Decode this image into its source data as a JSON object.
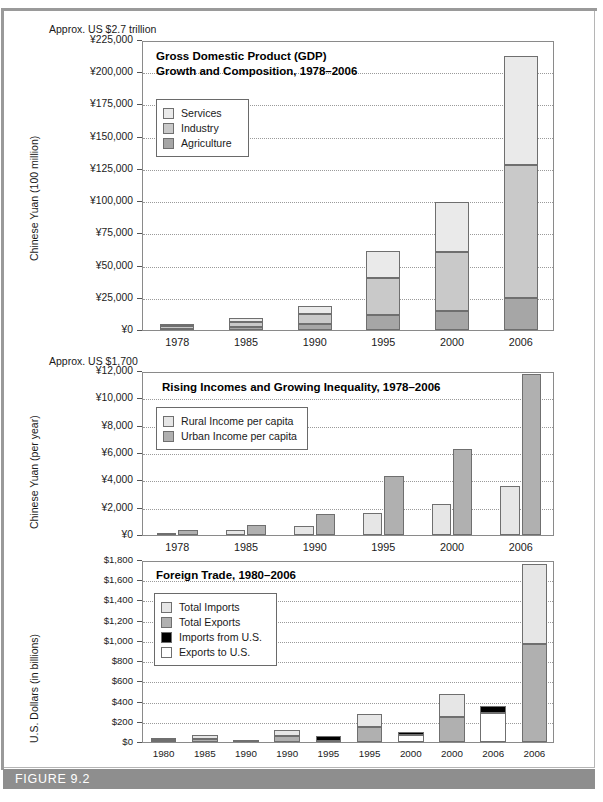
{
  "figure": {
    "caption": "FIGURE 9.2",
    "frame_border_color": "#b5b5b5",
    "caption_bar_color": "#8e8e8e"
  },
  "palette": {
    "services": "#eaeaea",
    "industry": "#c9c9c9",
    "agriculture": "#a6a6a6",
    "rural": "#e6e6e6",
    "urban": "#b0b0b0",
    "total_imports": "#e6e6e6",
    "total_exports": "#b0b0b0",
    "imports_from_us": "#000000",
    "exports_to_us": "#ffffff"
  },
  "chart_data": [
    {
      "id": "gdp",
      "type": "bar",
      "stacked": true,
      "title": "Gross Domestic Product (GDP)\nGrowth and Composition, 1978–2006",
      "title_line1": "Gross Domestic Product (GDP)",
      "title_line2": "Growth and Composition, 1978–2006",
      "note": "Approx. US $2.7 trillion",
      "ylabel": "Chinese Yuan (100 million)",
      "xlabel": "",
      "ylim": [
        0,
        225000
      ],
      "ytick_labels": [
        "¥0",
        "¥25,000",
        "¥50,000",
        "¥75,000",
        "¥100,000",
        "¥125,000",
        "¥150,000",
        "¥175,000",
        "¥200,000",
        "¥225,000"
      ],
      "ytick_values": [
        0,
        25000,
        50000,
        75000,
        100000,
        125000,
        150000,
        175000,
        200000,
        225000
      ],
      "grid": true,
      "categories": [
        "1978",
        "1985",
        "1990",
        "1995",
        "2000",
        "2006"
      ],
      "legend_position": "upper-left-inside",
      "series": [
        {
          "name": "Agriculture",
          "color_key": "agriculture",
          "values": [
            1018,
            2542,
            5017,
            12020,
            14945,
            24737
          ]
        },
        {
          "name": "Industry",
          "color_key": "industry",
          "values": [
            1745,
            3867,
            7717,
            28538,
            45556,
            103162
          ]
        },
        {
          "name": "Services",
          "color_key": "services",
          "values": [
            881,
            2585,
            5888,
            21066,
            38714,
            84721
          ]
        }
      ]
    },
    {
      "id": "incomes",
      "type": "bar",
      "stacked": false,
      "title": "Rising Incomes and Growing Inequality, 1978–2006",
      "note": "Approx. US $1,700",
      "ylabel": "Chinese Yuan (per year)",
      "xlabel": "",
      "ylim": [
        0,
        12000
      ],
      "ytick_labels": [
        "¥0",
        "¥2,000",
        "¥4,000",
        "¥6,000",
        "¥8,000",
        "¥10,000",
        "¥12,000"
      ],
      "ytick_values": [
        0,
        2000,
        4000,
        6000,
        8000,
        10000,
        12000
      ],
      "grid": true,
      "categories": [
        "1978",
        "1985",
        "1990",
        "1995",
        "2000",
        "2006"
      ],
      "legend_position": "upper-left-inside",
      "series": [
        {
          "name": "Rural Income per capita",
          "color_key": "rural",
          "values": [
            134,
            398,
            686,
            1578,
            2253,
            3587
          ]
        },
        {
          "name": "Urban Income per capita",
          "color_key": "urban",
          "values": [
            343,
            739,
            1510,
            4283,
            6280,
            11759
          ]
        }
      ]
    },
    {
      "id": "trade",
      "type": "bar",
      "stacked": true,
      "title": "Foreign Trade, 1980–2006",
      "note": "",
      "ylabel": "U.S. Dollars (in billions)",
      "xlabel": "",
      "ylim": [
        0,
        1800
      ],
      "ytick_labels": [
        "$0",
        "$200",
        "$400",
        "$600",
        "$800",
        "$1,000",
        "$1,200",
        "$1,400",
        "$1,600",
        "$1,800"
      ],
      "ytick_values": [
        0,
        200,
        400,
        600,
        800,
        1000,
        1200,
        1400,
        1600,
        1800
      ],
      "grid": true,
      "categories": [
        "1980",
        "1985",
        "1990",
        "1990",
        "1995",
        "1995",
        "2000",
        "2000",
        "2006",
        "2006"
      ],
      "legend_position": "upper-left-inside",
      "legend_entries": [
        {
          "name": "Total Imports",
          "color_key": "total_imports"
        },
        {
          "name": "Total Exports",
          "color_key": "total_exports"
        },
        {
          "name": "Imports from U.S.",
          "color_key": "imports_from_us"
        },
        {
          "name": "Exports to U.S.",
          "color_key": "exports_to_us"
        }
      ],
      "bars": [
        {
          "label": "1980",
          "segments": [
            {
              "color_key": "total_exports",
              "value": 18
            },
            {
              "color_key": "total_imports",
              "value": 20
            }
          ]
        },
        {
          "label": "1985",
          "segments": [
            {
              "color_key": "total_exports",
              "value": 27
            },
            {
              "color_key": "total_imports",
              "value": 42
            }
          ]
        },
        {
          "label": "1990",
          "segments": [
            {
              "color_key": "exports_to_us",
              "value": 5
            },
            {
              "color_key": "imports_from_us",
              "value": 16
            }
          ]
        },
        {
          "label": "1990",
          "segments": [
            {
              "color_key": "total_exports",
              "value": 62
            },
            {
              "color_key": "total_imports",
              "value": 53
            }
          ]
        },
        {
          "label": "1995",
          "segments": [
            {
              "color_key": "exports_to_us",
              "value": 12
            },
            {
              "color_key": "imports_from_us",
              "value": 46
            }
          ]
        },
        {
          "label": "1995",
          "segments": [
            {
              "color_key": "total_exports",
              "value": 149
            },
            {
              "color_key": "total_imports",
              "value": 132
            }
          ]
        },
        {
          "label": "2000",
          "segments": [
            {
              "color_key": "exports_to_us",
              "value": 68
            },
            {
              "color_key": "imports_from_us",
              "value": 33
            }
          ]
        },
        {
          "label": "2000",
          "segments": [
            {
              "color_key": "total_exports",
              "value": 249
            },
            {
              "color_key": "total_imports",
              "value": 225
            }
          ]
        },
        {
          "label": "2006",
          "segments": [
            {
              "color_key": "exports_to_us",
              "value": 288
            },
            {
              "color_key": "imports_from_us",
              "value": 68
            }
          ]
        },
        {
          "label": "2006",
          "segments": [
            {
              "color_key": "total_exports",
              "value": 969
            },
            {
              "color_key": "total_imports",
              "value": 791
            }
          ]
        }
      ]
    }
  ]
}
